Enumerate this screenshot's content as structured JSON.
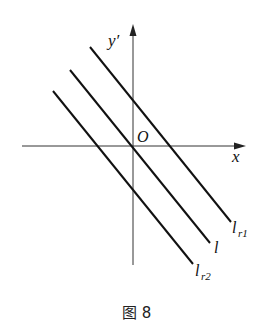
{
  "figure": {
    "caption": "图 8",
    "axes": {
      "x_label": "x",
      "y_label": "y′",
      "origin_label": "O"
    },
    "lines": [
      {
        "id": "lr1",
        "label_main": "l",
        "label_sub": "r1"
      },
      {
        "id": "l",
        "label_main": "l",
        "label_sub": ""
      },
      {
        "id": "lr2",
        "label_main": "l",
        "label_sub": "r2"
      }
    ],
    "colors": {
      "stroke": "#111111",
      "background": "#ffffff"
    }
  }
}
